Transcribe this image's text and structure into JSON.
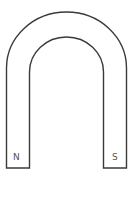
{
  "diagram": {
    "type": "horseshoe-magnet",
    "stroke_color": "#3a3a3a",
    "fill_color": "#ffffff",
    "poles": {
      "left": {
        "label": "N"
      },
      "right": {
        "label": "S"
      }
    }
  }
}
